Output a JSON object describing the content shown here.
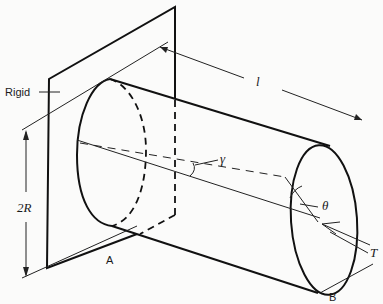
{
  "figure": {
    "labels": {
      "rigid": "Rigid",
      "length": "l",
      "diameter": "2R",
      "shear_strain": "γ",
      "twist_angle": "θ",
      "torque": "T",
      "end_a": "A",
      "end_b": "B"
    }
  }
}
